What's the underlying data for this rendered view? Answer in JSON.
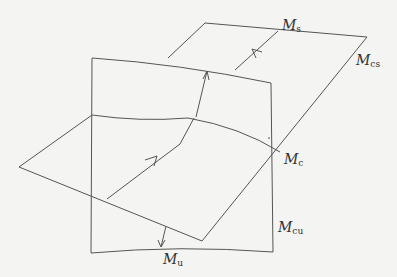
{
  "diagram": {
    "type": "invariant-manifolds-sketch",
    "labels": {
      "ms": {
        "main": "M",
        "sub": "s"
      },
      "mcs": {
        "main": "M",
        "sub": "cs"
      },
      "mc": {
        "main": "M",
        "sub": "c"
      },
      "mcu": {
        "main": "M",
        "sub": "cu"
      },
      "mu": {
        "main": "M",
        "sub": "u"
      }
    },
    "colors": {
      "line": "#555555",
      "background": "#f4f4f2",
      "text": "#333333"
    }
  }
}
